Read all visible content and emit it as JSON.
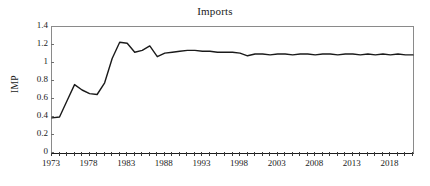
{
  "chart_data": {
    "type": "line",
    "title": "Imports",
    "xlabel": "",
    "ylabel": "IMP",
    "xlim": [
      1973,
      2021
    ],
    "ylim": [
      0,
      1.4
    ],
    "grid": false,
    "legend": "none",
    "y_ticks": [
      "1.4",
      "1.2",
      "1",
      "0.8",
      "0.6",
      "0.4",
      "0.2",
      "0"
    ],
    "y_tick_values": [
      1.4,
      1.2,
      1.0,
      0.8,
      0.6,
      0.4,
      0.2,
      0
    ],
    "x_ticks": [
      "1973",
      "1978",
      "1983",
      "1988",
      "1993",
      "1998",
      "2003",
      "2008",
      "2013",
      "2018"
    ],
    "x_tick_values": [
      1973,
      1978,
      1983,
      1988,
      1993,
      1998,
      2003,
      2008,
      2013,
      2018
    ],
    "x_tick_step_minor": 1,
    "series": [
      {
        "name": "IMP",
        "color": "#1a1a1a",
        "x": [
          1973,
          1974,
          1975,
          1976,
          1977,
          1978,
          1979,
          1980,
          1981,
          1982,
          1983,
          1984,
          1985,
          1986,
          1987,
          1988,
          1989,
          1990,
          1991,
          1992,
          1993,
          1994,
          1995,
          1996,
          1997,
          1998,
          1999,
          2000,
          2001,
          2002,
          2003,
          2004,
          2005,
          2006,
          2007,
          2008,
          2009,
          2010,
          2011,
          2012,
          2013,
          2014,
          2015,
          2016,
          2017,
          2018,
          2019,
          2020,
          2021
        ],
        "values": [
          0.39,
          0.4,
          0.58,
          0.76,
          0.7,
          0.66,
          0.65,
          0.78,
          1.05,
          1.23,
          1.22,
          1.12,
          1.14,
          1.19,
          1.07,
          1.11,
          1.12,
          1.13,
          1.14,
          1.14,
          1.13,
          1.13,
          1.12,
          1.12,
          1.12,
          1.11,
          1.08,
          1.1,
          1.1,
          1.09,
          1.1,
          1.1,
          1.09,
          1.1,
          1.1,
          1.09,
          1.1,
          1.1,
          1.09,
          1.1,
          1.1,
          1.09,
          1.1,
          1.09,
          1.1,
          1.09,
          1.1,
          1.09,
          1.09
        ]
      }
    ]
  }
}
